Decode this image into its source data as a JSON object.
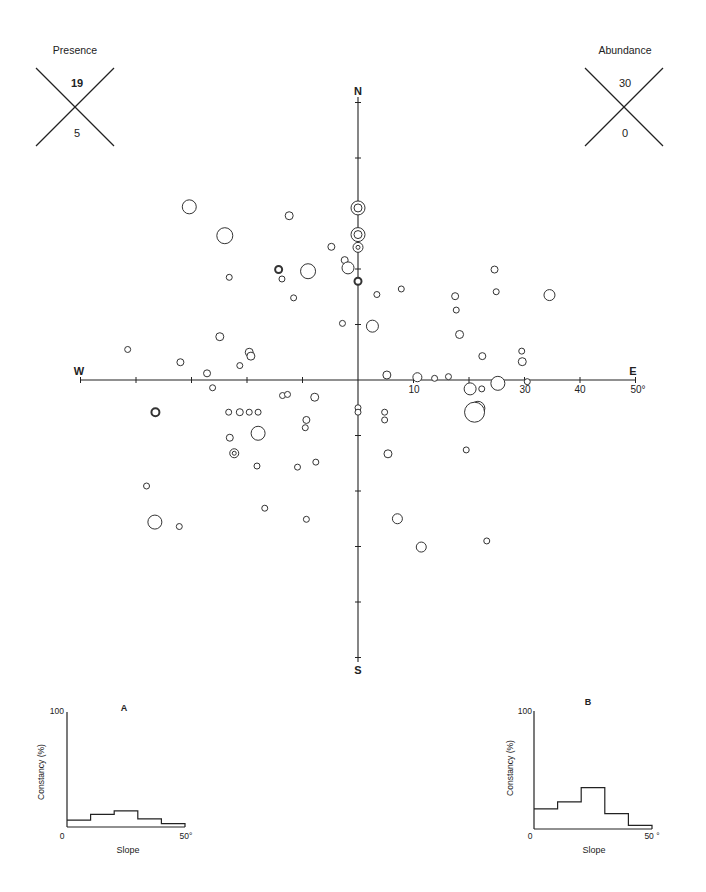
{
  "chart_data": [
    {
      "id": "aspect_slope_polar",
      "type": "scatter",
      "title": "",
      "description": "Aspect (compass direction) vs slope (degrees) plot; distance from centre = slope, direction = aspect. Circle size encodes abundance; bold/double circles encode presence.",
      "axes": {
        "north_label": "N",
        "south_label": "S",
        "east_label": "E",
        "west_label": "W",
        "tick_labels": [
          "10",
          "30",
          "40",
          "50°"
        ],
        "tick_values": [
          10,
          20,
          30,
          40,
          50
        ],
        "range": [
          0,
          50
        ],
        "unit": "degrees slope"
      },
      "legend": [
        {
          "title": "Presence",
          "top_value": "19",
          "bottom_value": "5"
        },
        {
          "title": "Abundance",
          "top_value": "30",
          "bottom_value": "0"
        }
      ],
      "points": [
        {
          "x": -30.4,
          "y": 31.2,
          "r": 7,
          "style": "plain"
        },
        {
          "x": -24.0,
          "y": 26.0,
          "r": 8,
          "style": "plain"
        },
        {
          "x": -12.4,
          "y": 29.6,
          "r": 4,
          "style": "plain"
        },
        {
          "x": -4.8,
          "y": 24.0,
          "r": 3.5,
          "style": "plain"
        },
        {
          "x": -2.4,
          "y": 21.6,
          "r": 3.5,
          "style": "plain"
        },
        {
          "x": 0,
          "y": 31.0,
          "r": 7,
          "style": "double"
        },
        {
          "x": 0,
          "y": 26.2,
          "r": 7,
          "style": "double"
        },
        {
          "x": 0,
          "y": 23.9,
          "r": 5,
          "style": "double"
        },
        {
          "x": -1.8,
          "y": 20.2,
          "r": 6,
          "style": "plain"
        },
        {
          "x": -9,
          "y": 19.6,
          "r": 7.5,
          "style": "plain"
        },
        {
          "x": -14.3,
          "y": 19.9,
          "r": 3.5,
          "style": "bold"
        },
        {
          "x": -13.7,
          "y": 18.2,
          "r": 3,
          "style": "plain"
        },
        {
          "x": -23.2,
          "y": 18.5,
          "r": 3,
          "style": "plain"
        },
        {
          "x": 0,
          "y": 17.8,
          "r": 3.5,
          "style": "bold"
        },
        {
          "x": -11.6,
          "y": 14.8,
          "r": 3,
          "style": "plain"
        },
        {
          "x": 3.4,
          "y": 15.4,
          "r": 3,
          "style": "plain"
        },
        {
          "x": 7.8,
          "y": 16.4,
          "r": 3,
          "style": "plain"
        },
        {
          "x": 24.6,
          "y": 19.9,
          "r": 3.5,
          "style": "plain"
        },
        {
          "x": 24.9,
          "y": 15.9,
          "r": 3,
          "style": "plain"
        },
        {
          "x": 17.5,
          "y": 15.1,
          "r": 3.5,
          "style": "plain"
        },
        {
          "x": 17.7,
          "y": 12.6,
          "r": 3,
          "style": "plain"
        },
        {
          "x": 34.5,
          "y": 15.3,
          "r": 5.5,
          "style": "plain"
        },
        {
          "x": 2.6,
          "y": 9.7,
          "r": 6,
          "style": "plain"
        },
        {
          "x": -2.8,
          "y": 10.2,
          "r": 3,
          "style": "plain"
        },
        {
          "x": 18.3,
          "y": 8.2,
          "r": 4,
          "style": "plain"
        },
        {
          "x": -41.5,
          "y": 5.5,
          "r": 3,
          "style": "plain"
        },
        {
          "x": -32,
          "y": 3.2,
          "r": 3.5,
          "style": "plain"
        },
        {
          "x": -24.9,
          "y": 7.8,
          "r": 4,
          "style": "plain"
        },
        {
          "x": -19.6,
          "y": 5.0,
          "r": 4,
          "style": "plain"
        },
        {
          "x": -19.3,
          "y": 4.3,
          "r": 4,
          "style": "plain"
        },
        {
          "x": -21.3,
          "y": 2.6,
          "r": 3,
          "style": "plain"
        },
        {
          "x": -27.2,
          "y": 1.2,
          "r": 3.5,
          "style": "plain"
        },
        {
          "x": -26.2,
          "y": -1.4,
          "r": 3,
          "style": "plain"
        },
        {
          "x": 5.2,
          "y": 0.9,
          "r": 4,
          "style": "plain"
        },
        {
          "x": 10.7,
          "y": 0.5,
          "r": 4.5,
          "style": "plain"
        },
        {
          "x": 13.8,
          "y": 0.3,
          "r": 3,
          "style": "plain"
        },
        {
          "x": 16.3,
          "y": 0.6,
          "r": 3,
          "style": "plain"
        },
        {
          "x": 22.4,
          "y": 4.3,
          "r": 3.5,
          "style": "plain"
        },
        {
          "x": 29.5,
          "y": 5.2,
          "r": 3,
          "style": "plain"
        },
        {
          "x": 29.6,
          "y": 3.3,
          "r": 4,
          "style": "plain"
        },
        {
          "x": 30.5,
          "y": -0.3,
          "r": 3,
          "style": "plain"
        },
        {
          "x": 20.2,
          "y": -1.6,
          "r": 6,
          "style": "plain"
        },
        {
          "x": 22.3,
          "y": -1.6,
          "r": 3,
          "style": "plain"
        },
        {
          "x": 25.2,
          "y": -0.6,
          "r": 7,
          "style": "plain"
        },
        {
          "x": 21.6,
          "y": -5.1,
          "r": 7,
          "style": "plain"
        },
        {
          "x": -36.5,
          "y": -5.8,
          "r": 4,
          "style": "bold"
        },
        {
          "x": -23.3,
          "y": -5.8,
          "r": 3,
          "style": "plain"
        },
        {
          "x": -21.3,
          "y": -5.8,
          "r": 3.5,
          "style": "plain"
        },
        {
          "x": -19.6,
          "y": -5.8,
          "r": 3,
          "style": "plain"
        },
        {
          "x": -18.0,
          "y": -5.8,
          "r": 3,
          "style": "plain"
        },
        {
          "x": -13.6,
          "y": -2.8,
          "r": 3,
          "style": "plain"
        },
        {
          "x": -12.7,
          "y": -2.6,
          "r": 3,
          "style": "plain"
        },
        {
          "x": -7.8,
          "y": -3.1,
          "r": 4,
          "style": "plain"
        },
        {
          "x": 0,
          "y": -5.0,
          "r": 3,
          "style": "plain"
        },
        {
          "x": 0,
          "y": -5.8,
          "r": 3,
          "style": "plain"
        },
        {
          "x": 4.8,
          "y": -5.8,
          "r": 3,
          "style": "plain"
        },
        {
          "x": 21.0,
          "y": -5.8,
          "r": 10,
          "style": "plain"
        },
        {
          "x": -9.3,
          "y": -7.2,
          "r": 3.5,
          "style": "plain"
        },
        {
          "x": -9.5,
          "y": -8.6,
          "r": 3,
          "style": "plain"
        },
        {
          "x": -18.0,
          "y": -9.6,
          "r": 7,
          "style": "plain"
        },
        {
          "x": 4.8,
          "y": -7.2,
          "r": 3,
          "style": "plain"
        },
        {
          "x": -23.1,
          "y": -10.4,
          "r": 3.5,
          "style": "plain"
        },
        {
          "x": -22.3,
          "y": -13.2,
          "r": 4.5,
          "style": "double"
        },
        {
          "x": -18.2,
          "y": -15.5,
          "r": 3,
          "style": "plain"
        },
        {
          "x": -10.9,
          "y": -15.7,
          "r": 3,
          "style": "plain"
        },
        {
          "x": -7.6,
          "y": -14.8,
          "r": 3,
          "style": "plain"
        },
        {
          "x": 5.4,
          "y": -13.3,
          "r": 4,
          "style": "plain"
        },
        {
          "x": 19.5,
          "y": -12.6,
          "r": 3,
          "style": "plain"
        },
        {
          "x": -38.1,
          "y": -19.1,
          "r": 3,
          "style": "plain"
        },
        {
          "x": -16.8,
          "y": -23.1,
          "r": 3,
          "style": "plain"
        },
        {
          "x": -36.6,
          "y": -25.6,
          "r": 7,
          "style": "plain"
        },
        {
          "x": -32.2,
          "y": -26.4,
          "r": 3,
          "style": "plain"
        },
        {
          "x": -9.3,
          "y": -25.1,
          "r": 3,
          "style": "plain"
        },
        {
          "x": 7.1,
          "y": -25.0,
          "r": 5,
          "style": "plain"
        },
        {
          "x": 11.4,
          "y": -30.1,
          "r": 5,
          "style": "plain"
        },
        {
          "x": 23.2,
          "y": -29.0,
          "r": 3,
          "style": "plain"
        }
      ]
    },
    {
      "id": "histogram_A",
      "type": "bar",
      "title": "A",
      "xlabel": "Slope",
      "ylabel": "Constancy (%)",
      "ylim": [
        0,
        100
      ],
      "xlim": [
        0,
        50
      ],
      "x_tick_labels": [
        "0",
        "50°"
      ],
      "y_tick_labels": [
        "0",
        "100"
      ],
      "categories": [
        "0-10",
        "10-20",
        "20-30",
        "30-40",
        "40-50"
      ],
      "values": [
        6,
        11,
        14,
        7,
        3
      ]
    },
    {
      "id": "histogram_B",
      "type": "bar",
      "title": "B",
      "xlabel": "Slope",
      "ylabel": "Constancy (%)",
      "ylim": [
        0,
        100
      ],
      "xlim": [
        0,
        50
      ],
      "x_tick_labels": [
        "0",
        "50 °"
      ],
      "y_tick_labels": [
        "0",
        "100"
      ],
      "categories": [
        "0-10",
        "10-20",
        "20-30",
        "30-40",
        "40-50"
      ],
      "values": [
        17,
        23,
        35,
        13,
        3
      ]
    }
  ],
  "legend_presence": {
    "title": "Presence",
    "top": "19",
    "bottom": "5"
  },
  "legend_abundance": {
    "title": "Abundance",
    "top": "30",
    "bottom": "0"
  },
  "compass": {
    "n": "N",
    "s": "S",
    "e": "E",
    "w": "W"
  },
  "east_ticks": [
    "10",
    "30",
    "40",
    "50°"
  ],
  "hist_a": {
    "title": "A",
    "ylabel": "Constancy (%)",
    "xlabel": "Slope",
    "y_max": "100",
    "x_min": "0",
    "x_max": "50°"
  },
  "hist_b": {
    "title": "B",
    "ylabel": "Constancy (%)",
    "xlabel": "Slope",
    "y_max": "100",
    "x_min": "0",
    "x_max": "50 °"
  }
}
